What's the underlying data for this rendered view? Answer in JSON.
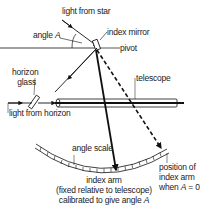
{
  "diagram": {
    "labels": {
      "light_from_star": "light from star",
      "angle_prefix": "angle ",
      "angle_symbol": "A",
      "index_mirror": "index mirror",
      "pivot": "pivot",
      "horizon_glass_line1": "horizon",
      "horizon_glass_line2": "glass",
      "telescope": "telescope",
      "light_from_horizon": "light from horizon",
      "angle_scale": "angle scale",
      "index_arm": "index arm",
      "index_arm_note1": "(fixed relative to telescope)",
      "index_arm_note2_prefix": "calibrated to give angle ",
      "index_arm_note2_symbol": "A",
      "zero_position_line1": "position of",
      "zero_position_line2": "index arm",
      "zero_position_line3_prefix": "when ",
      "zero_position_line3_symbol": "A",
      "zero_position_line3_suffix": " = 0"
    },
    "colors": {
      "line": "#111111",
      "background": "#ffffff"
    }
  }
}
